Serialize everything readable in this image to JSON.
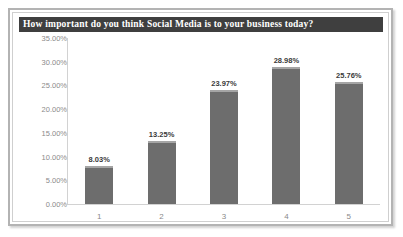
{
  "chart_data": {
    "type": "bar",
    "title": "How important do you think Social Media is to your business today?",
    "categories": [
      "1",
      "2",
      "3",
      "4",
      "5"
    ],
    "values": [
      8.03,
      13.25,
      23.97,
      28.98,
      25.76
    ],
    "data_labels": [
      "8.03%",
      "13.25%",
      "23.97%",
      "28.98%",
      "25.76%"
    ],
    "xlabel": "",
    "ylabel": "",
    "ylim": [
      0,
      35
    ],
    "ytick_labels": [
      "35.00%",
      "30.00%",
      "25.00%",
      "20.00%",
      "15.00%",
      "10.00%",
      "5.00%",
      "0.00%"
    ],
    "ytick_values": [
      35,
      30,
      25,
      20,
      15,
      10,
      5,
      0
    ],
    "grid": false,
    "legend": false,
    "bar_color": "#6d6d6d",
    "title_bar_color": "#3f3f3f",
    "axis_color": "#d2d2d2",
    "tick_label_color": "#8a8a8a"
  }
}
